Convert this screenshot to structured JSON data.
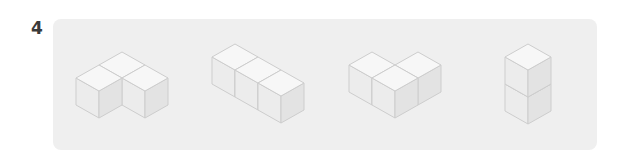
{
  "question": {
    "number": "4"
  },
  "style": {
    "panel_bg": "#efefef",
    "top_face": "#f7f7f7",
    "left_face": "#ececec",
    "right_face": "#e3e3e3",
    "edge": "#cdcdcd"
  },
  "cube_size": {
    "a": 23,
    "b": 13,
    "h": 27
  },
  "figures": [
    {
      "name": "l-shape-three-cubes",
      "origin": [
        122,
        52
      ],
      "cubes": [
        [
          0,
          0,
          0
        ],
        [
          1,
          0,
          0
        ],
        [
          0,
          1,
          0
        ]
      ]
    },
    {
      "name": "straight-row-three-cubes",
      "origin": [
        235,
        44
      ],
      "cubes": [
        [
          0,
          0,
          0
        ],
        [
          1,
          0,
          0
        ],
        [
          2,
          0,
          0
        ]
      ]
    },
    {
      "name": "bent-row-three-cubes",
      "origin": [
        395,
        39
      ],
      "cubes": [
        [
          1,
          0,
          0
        ],
        [
          0,
          1,
          0
        ],
        [
          1,
          1,
          0
        ]
      ]
    },
    {
      "name": "vertical-stack-two-cubes",
      "origin": [
        528,
        71
      ],
      "cubes": [
        [
          0,
          0,
          0
        ],
        [
          0,
          0,
          1
        ]
      ]
    }
  ]
}
